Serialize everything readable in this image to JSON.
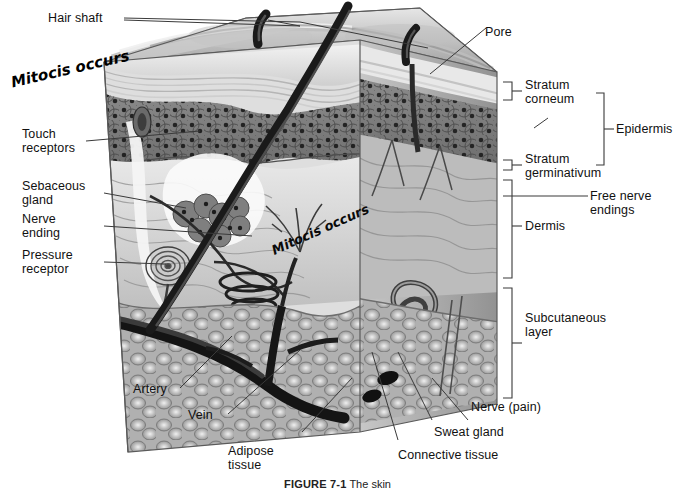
{
  "figure": {
    "caption_number": "FIGURE 7-1",
    "caption_title": "The skin"
  },
  "handwritten_notes": [
    {
      "text": "Mitocis\noccurs",
      "location": "left margin beside epidermis"
    },
    {
      "text": "Mitocis\noccurs",
      "location": "on dermis of block"
    }
  ],
  "left_labels": [
    {
      "label": "Hair shaft"
    },
    {
      "label": "Touch\nreceptors"
    },
    {
      "label": "Sebaceous\ngland"
    },
    {
      "label": "Nerve\nending"
    },
    {
      "label": "Pressure\nreceptor"
    },
    {
      "label": "Artery"
    },
    {
      "label": "Vein"
    },
    {
      "label": "Adipose\ntissue"
    }
  ],
  "right_labels": [
    {
      "label": "Pore"
    },
    {
      "label": "Stratum\ncorneum"
    },
    {
      "label": "Epidermis"
    },
    {
      "label": "Stratum\ngerminativum"
    },
    {
      "label": "Free nerve\nendings"
    },
    {
      "label": "Dermis"
    },
    {
      "label": "Subcutaneous\nlayer"
    },
    {
      "label": "Nerve (pain)"
    },
    {
      "label": "Sweat gland"
    },
    {
      "label": "Connective tissue"
    }
  ],
  "brackets": [
    {
      "name": "Stratum corneum",
      "span": "top keratin layers"
    },
    {
      "name": "Epidermis",
      "span": "stratum corneum through stratum germinativum"
    },
    {
      "name": "Dermis",
      "span": "below epidermis to subcutaneous layer"
    },
    {
      "name": "Subcutaneous layer",
      "span": "bottom fatty layer"
    }
  ],
  "colors": {
    "ink": "#111111",
    "leader": "#3a3a3a",
    "epidermis_dark": "#7d7d7d",
    "dermis_mid": "#9a9a9a",
    "subcutaneous": "#b5b5b5",
    "surface_light": "#d8d8d8",
    "hair": "#1d1d1d",
    "paper": "#ffffff"
  }
}
